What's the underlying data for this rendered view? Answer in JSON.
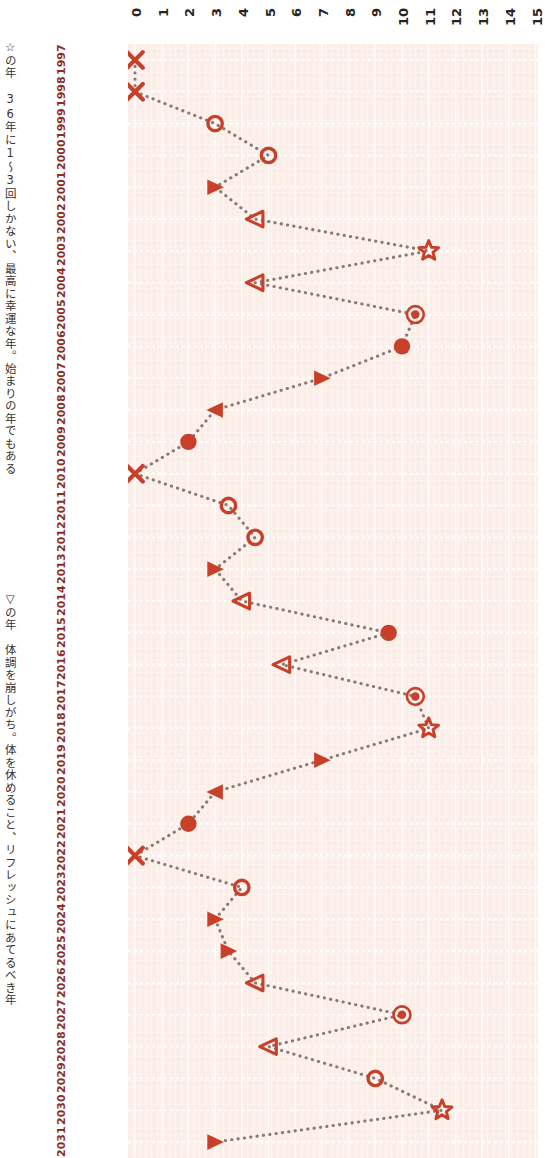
{
  "annotations": {
    "star_note": "☆の年　36年に1〜3回しかない、最高に幸運な年。始まりの年でもある",
    "triangle_note": "▽の年　体調を崩しがち。体を休めること、リフレッシュにあてるべき年"
  },
  "chart_data": {
    "type": "line",
    "title": "",
    "xlabel": "",
    "ylabel": "",
    "orientation": "horizontal-value-vertical-category",
    "grid": true,
    "legend_position": "none",
    "value_axis": {
      "min": 0,
      "max": 15,
      "ticks": [
        0,
        1,
        2,
        3,
        4,
        5,
        6,
        7,
        8,
        9,
        10,
        11,
        12,
        13,
        14,
        15
      ]
    },
    "accent_color": "#c8402a",
    "line_color": "#7a6a62",
    "plot_background": "#fbeee9",
    "categories": [
      "1997",
      "1998",
      "1999",
      "2000",
      "2001",
      "2002",
      "2003",
      "2004",
      "2005",
      "2006",
      "2007",
      "2008",
      "2009",
      "2010",
      "2011",
      "2012",
      "2013",
      "2014",
      "2015",
      "2016",
      "2017",
      "2018",
      "2019",
      "2020",
      "2021",
      "2022",
      "2023",
      "2024",
      "2025",
      "2026",
      "2027",
      "2028",
      "2029",
      "2030",
      "2031"
    ],
    "values": [
      0,
      0,
      3,
      5,
      3,
      4.5,
      11,
      4.5,
      10.5,
      10,
      7,
      3,
      2,
      0,
      3.5,
      4.5,
      3,
      4,
      9.5,
      5.5,
      10.5,
      11,
      7,
      3,
      2,
      0,
      4,
      3,
      3.5,
      4.5,
      10,
      5,
      9,
      11.5,
      3
    ],
    "markers": [
      "cross",
      "cross",
      "open-circle",
      "open-circle",
      "filled-triangle",
      "open-triangle",
      "star",
      "open-triangle",
      "double-circle",
      "filled-circle",
      "filled-triangle",
      "filled-triangle-left",
      "filled-circle",
      "cross",
      "open-circle",
      "open-circle",
      "filled-triangle",
      "open-triangle",
      "filled-circle",
      "open-triangle",
      "double-circle",
      "star",
      "filled-triangle",
      "filled-triangle-left",
      "filled-circle",
      "cross",
      "open-circle",
      "filled-triangle",
      "filled-triangle",
      "open-triangle",
      "double-circle",
      "open-triangle",
      "open-circle",
      "star",
      "filled-triangle"
    ],
    "marker_legend": {
      "star": "最高に幸運な年",
      "open-triangle": "体調を崩しがちな年"
    }
  }
}
